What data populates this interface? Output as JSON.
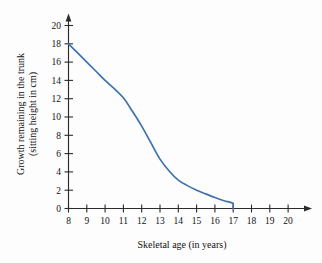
{
  "chart_data": {
    "type": "line",
    "title": "",
    "xlabel": "Skeletal age (in years)",
    "ylabel_line1": "Growth remaining in the trunk",
    "ylabel_line2": "(sitting height in cm)",
    "xlim": [
      8,
      20
    ],
    "ylim": [
      0,
      20
    ],
    "xticks": [
      8,
      9,
      10,
      11,
      12,
      13,
      14,
      15,
      16,
      17,
      18,
      19,
      20
    ],
    "yticks": [
      0,
      2,
      4,
      6,
      8,
      10,
      12,
      14,
      16,
      18,
      20
    ],
    "xtick_labels": [
      "8",
      "9",
      "10",
      "11",
      "12",
      "13",
      "14",
      "15",
      "16",
      "17",
      "18",
      "19",
      "20"
    ],
    "ytick_labels": [
      "0",
      "2",
      "4",
      "6",
      "8",
      "10",
      "12",
      "14",
      "16",
      "18",
      "20"
    ],
    "grid": false,
    "legend": false,
    "series": [
      {
        "name": "Growth remaining",
        "color": "#3f72ac",
        "x": [
          8.0,
          8.5,
          9.0,
          9.5,
          10.0,
          10.5,
          11.0,
          11.5,
          12.0,
          12.5,
          13.0,
          13.5,
          14.0,
          14.5,
          15.0,
          15.5,
          16.0,
          16.5,
          17.0,
          17.0
        ],
        "values": [
          18.0,
          17.0,
          16.0,
          15.0,
          14.0,
          13.1,
          12.1,
          10.6,
          9.0,
          7.2,
          5.4,
          4.1,
          3.1,
          2.5,
          2.0,
          1.6,
          1.2,
          0.85,
          0.55,
          0.0
        ]
      }
    ]
  },
  "axes": {
    "x_axis_name": "x-axis",
    "y_axis_name": "y-axis",
    "x_arrow": true,
    "y_arrow": true
  }
}
